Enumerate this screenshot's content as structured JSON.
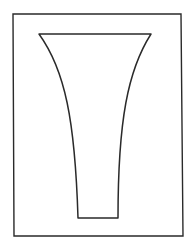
{
  "figure": {
    "stroke_color": "#2a2a2a",
    "background": "#ffffff",
    "frame": {
      "x1": 13,
      "y1": 14,
      "x2": 182,
      "y2": 236
    },
    "vase": {
      "top_left": [
        39,
        34
      ],
      "top_right": [
        151,
        34
      ],
      "bottom_left": [
        78,
        218
      ],
      "bottom_right": [
        118,
        218
      ]
    }
  }
}
